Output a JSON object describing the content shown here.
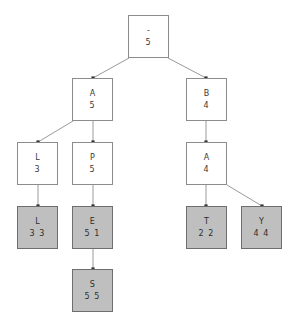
{
  "diagram": {
    "type": "tree",
    "title": "",
    "node_count": 11,
    "colors": {
      "node_fill_empty": "#ffffff",
      "node_fill_leaf": "#bfbfbf",
      "node_border": "#8c8c8c",
      "edge": "#9a9a9a",
      "text": "#3a3a3a",
      "background": "#ffffff"
    },
    "nodes": [
      {
        "id": "root",
        "label": "-",
        "value": "5",
        "filled": false,
        "x": 128,
        "y": 15,
        "w": 41,
        "h": 43
      },
      {
        "id": "a5",
        "label": "A",
        "value": "5",
        "filled": false,
        "x": 72,
        "y": 78,
        "w": 41,
        "h": 43
      },
      {
        "id": "b4",
        "label": "B",
        "value": "4",
        "filled": false,
        "x": 186,
        "y": 78,
        "w": 41,
        "h": 43
      },
      {
        "id": "l3",
        "label": "L",
        "value": "3",
        "filled": false,
        "x": 17,
        "y": 142,
        "w": 41,
        "h": 43
      },
      {
        "id": "p5",
        "label": "P",
        "value": "5",
        "filled": false,
        "x": 72,
        "y": 142,
        "w": 41,
        "h": 43
      },
      {
        "id": "a4",
        "label": "A",
        "value": "4",
        "filled": false,
        "x": 186,
        "y": 142,
        "w": 41,
        "h": 43
      },
      {
        "id": "l33",
        "label": "L",
        "value": "3 3",
        "filled": true,
        "x": 17,
        "y": 206,
        "w": 41,
        "h": 43
      },
      {
        "id": "e51",
        "label": "E",
        "value": "5 1",
        "filled": true,
        "x": 72,
        "y": 206,
        "w": 41,
        "h": 43
      },
      {
        "id": "t22",
        "label": "T",
        "value": "2 2",
        "filled": true,
        "x": 186,
        "y": 206,
        "w": 41,
        "h": 43
      },
      {
        "id": "y44",
        "label": "Y",
        "value": "4 4",
        "filled": true,
        "x": 241,
        "y": 206,
        "w": 41,
        "h": 43
      },
      {
        "id": "s55",
        "label": "S",
        "value": "5 5",
        "filled": true,
        "x": 72,
        "y": 269,
        "w": 41,
        "h": 43
      }
    ],
    "edges": [
      {
        "from": "root",
        "to": "a5",
        "x1": 129,
        "y1": 58,
        "x2": 93,
        "y2": 78
      },
      {
        "from": "root",
        "to": "b4",
        "x1": 168,
        "y1": 58,
        "x2": 206,
        "y2": 78
      },
      {
        "from": "a5",
        "to": "l3",
        "x1": 73,
        "y1": 121,
        "x2": 38,
        "y2": 142
      },
      {
        "from": "a5",
        "to": "p5",
        "x1": 93,
        "y1": 121,
        "x2": 93,
        "y2": 142
      },
      {
        "from": "b4",
        "to": "a4",
        "x1": 206,
        "y1": 121,
        "x2": 206,
        "y2": 142
      },
      {
        "from": "l3",
        "to": "l33",
        "x1": 38,
        "y1": 185,
        "x2": 38,
        "y2": 206
      },
      {
        "from": "p5",
        "to": "e51",
        "x1": 93,
        "y1": 185,
        "x2": 93,
        "y2": 206
      },
      {
        "from": "a4",
        "to": "t22",
        "x1": 206,
        "y1": 185,
        "x2": 206,
        "y2": 206
      },
      {
        "from": "a4",
        "to": "y44",
        "x1": 227,
        "y1": 185,
        "x2": 262,
        "y2": 206
      },
      {
        "from": "e51",
        "to": "s55",
        "x1": 93,
        "y1": 249,
        "x2": 93,
        "y2": 269
      }
    ]
  }
}
